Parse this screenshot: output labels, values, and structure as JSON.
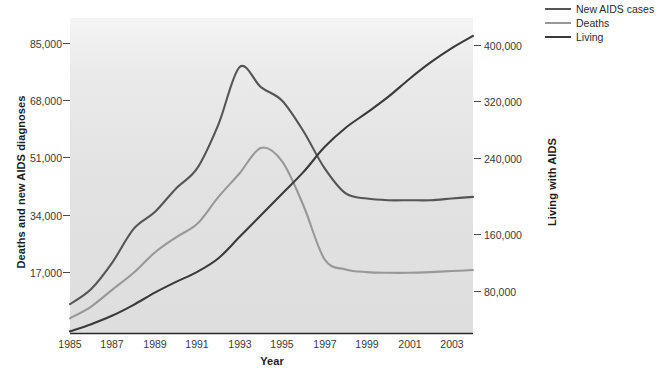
{
  "chart_data": {
    "type": "line",
    "title": "",
    "xlabel": "Year",
    "ylabel": "Deaths and new AIDS diagnoses",
    "y2label": "Living with AIDS",
    "grid": false,
    "legend_position": "top-right",
    "xlim": [
      1985,
      2004
    ],
    "ylim": [
      0,
      93500
    ],
    "y2lim": [
      0,
      440000
    ],
    "xticks": [
      "1985",
      "1987",
      "1989",
      "1991",
      "1993",
      "1995",
      "1997",
      "1999",
      "2001",
      "2003"
    ],
    "xtick_values": [
      1985,
      1987,
      1989,
      1991,
      1993,
      1995,
      1997,
      1999,
      2001,
      2003
    ],
    "yticks_left": [
      "17,000",
      "34,000",
      "51,000",
      "68,000",
      "85,000"
    ],
    "ytick_left_values": [
      17000,
      34000,
      51000,
      68000,
      85000
    ],
    "yticks_right": [
      "80,000",
      "160,000",
      "240,000",
      "320,000",
      "400,000"
    ],
    "ytick_right_values": [
      80000,
      160000,
      240000,
      320000,
      400000
    ],
    "x": [
      1985,
      1986,
      1987,
      1988,
      1989,
      1990,
      1991,
      1992,
      1993,
      1994,
      1995,
      1996,
      1997,
      1998,
      1999,
      2000,
      2001,
      2002,
      2003,
      2004
    ],
    "series": [
      {
        "name": "New AIDS cases",
        "axis": "left",
        "color": "#555555",
        "values": [
          8700,
          13200,
          21100,
          31000,
          36000,
          43000,
          49000,
          62000,
          79000,
          73000,
          69000,
          60000,
          49000,
          41500,
          40000,
          39500,
          39500,
          39500,
          40000,
          40500
        ]
      },
      {
        "name": "Deaths",
        "axis": "left",
        "color": "#989898",
        "values": [
          4500,
          8000,
          13000,
          18000,
          24000,
          28500,
          32500,
          40500,
          47500,
          55000,
          51000,
          38000,
          22000,
          19000,
          18200,
          18000,
          18000,
          18200,
          18500,
          18800
        ]
      },
      {
        "name": "Living",
        "axis": "right",
        "color": "#3a3a3a",
        "values": [
          3000,
          13000,
          25000,
          40000,
          57000,
          72000,
          86000,
          105000,
          135000,
          165000,
          195000,
          225000,
          260000,
          287000,
          308000,
          330000,
          355000,
          378000,
          398000,
          415000
        ]
      }
    ]
  },
  "legend": {
    "items": [
      {
        "label": "New AIDS cases",
        "color": "#555555"
      },
      {
        "label": "Deaths",
        "color": "#989898"
      },
      {
        "label": "Living",
        "color": "#3a3a3a"
      }
    ]
  },
  "axes": {
    "x_title": "Year",
    "y_left_title": "Deaths and new AIDS diagnoses",
    "y_right_title": "Living with AIDS"
  }
}
